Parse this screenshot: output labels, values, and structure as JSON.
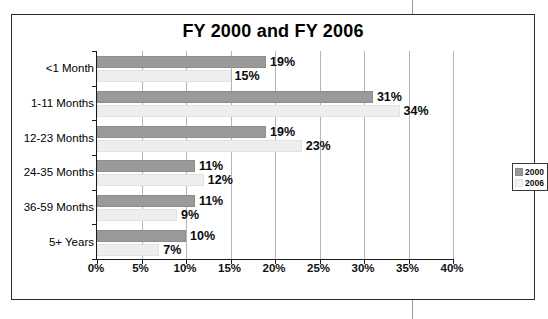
{
  "chart_data": {
    "type": "bar",
    "orientation": "horizontal",
    "title": "FY 2000 and FY 2006",
    "xlabel": "",
    "ylabel": "",
    "categories": [
      "<1 Month",
      "1-11 Months",
      "12-23 Months",
      "24-35 Months",
      "36-59 Months",
      "5+ Years"
    ],
    "series": [
      {
        "name": "2000",
        "color": "#9a9a9a",
        "values": [
          19,
          31,
          19,
          11,
          11,
          10
        ],
        "value_labels": [
          "19%",
          "31%",
          "19%",
          "11%",
          "11%",
          "10%"
        ]
      },
      {
        "name": "2006",
        "color": "#eeeeee",
        "values": [
          15,
          34,
          23,
          12,
          9,
          7
        ],
        "value_labels": [
          "15%",
          "34%",
          "23%",
          "12%",
          "9%",
          "7%"
        ]
      }
    ],
    "xlim": [
      0,
      40
    ],
    "xticks": [
      0,
      5,
      10,
      15,
      20,
      25,
      30,
      35,
      40
    ],
    "xtick_labels": [
      "0%",
      "5%",
      "10%",
      "15%",
      "20%",
      "25%",
      "30%",
      "35%",
      "40%"
    ],
    "grid": "vertical",
    "legend_position": "right",
    "legend_entries": [
      "2000",
      "2006"
    ]
  }
}
